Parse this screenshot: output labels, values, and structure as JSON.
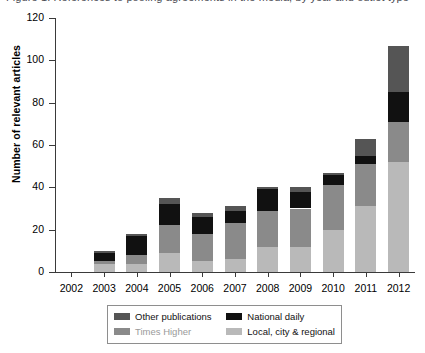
{
  "caption": {
    "text": "Figure 1. References to pooling agreements in the media, by year and outlet type"
  },
  "chart_data": {
    "type": "bar",
    "stacked": true,
    "title": "",
    "xlabel": "",
    "ylabel": "Number of relevant articles",
    "ylim": [
      0,
      120
    ],
    "yticks": [
      0,
      20,
      40,
      60,
      80,
      100,
      120
    ],
    "grid": false,
    "legend_position": "bottom",
    "categories": [
      "2002",
      "2003",
      "2004",
      "2005",
      "2006",
      "2007",
      "2008",
      "2009",
      "2010",
      "2011",
      "2012"
    ],
    "series": [
      {
        "name": "Local, city & regional",
        "color": "#b9b9b9",
        "values": [
          0,
          4,
          4,
          9,
          5,
          6,
          12,
          12,
          20,
          31,
          52
        ]
      },
      {
        "name": "Times Higher",
        "color": "#8a8a8a",
        "values": [
          0,
          1,
          4,
          13,
          13,
          17,
          17,
          18,
          21,
          20,
          19
        ]
      },
      {
        "name": "National daily",
        "color": "#111111",
        "values": [
          0,
          4,
          9,
          10,
          8,
          6,
          10,
          8,
          5,
          4,
          14
        ]
      },
      {
        "name": "Other publications",
        "color": "#555555",
        "values": [
          0,
          1,
          1,
          3,
          2,
          2,
          1,
          2,
          1,
          8,
          22
        ]
      }
    ],
    "totals": [
      0,
      10,
      18,
      35,
      28,
      31,
      40,
      40,
      47,
      63,
      107
    ]
  },
  "legend": {
    "entries": [
      {
        "label": "Other publications",
        "color": "#555555",
        "text_color": "#111111"
      },
      {
        "label": "National daily",
        "color": "#111111",
        "text_color": "#111111"
      },
      {
        "label": "Times Higher",
        "color": "#8a8a8a",
        "text_color": "#9a9a9a"
      },
      {
        "label": "Local, city & regional",
        "color": "#b9b9b9",
        "text_color": "#111111"
      }
    ]
  }
}
